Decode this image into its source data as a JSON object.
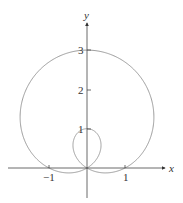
{
  "chart_data": {
    "type": "line",
    "subtype": "polar-curve",
    "equation": "r = 1 + 2 sin θ",
    "title": "",
    "xlabel": "x",
    "ylabel": "y",
    "x_ticks": [
      -1,
      1
    ],
    "x_tick_labels": [
      "−1",
      "1"
    ],
    "y_ticks": [
      1,
      2,
      3
    ],
    "y_tick_labels": [
      "1",
      "2",
      "3"
    ],
    "xlim": [
      -2.1,
      2.1
    ],
    "ylim": [
      -0.8,
      3.8
    ],
    "grid": false,
    "legend": null,
    "key_points": [
      {
        "x": 0,
        "y": 3,
        "note": "outer loop top"
      },
      {
        "x": 0,
        "y": 1,
        "note": "inner loop top"
      },
      {
        "x": 0,
        "y": 0,
        "note": "pole / self-intersection"
      },
      {
        "x": 1,
        "y": 0
      },
      {
        "x": -1,
        "y": 0
      }
    ],
    "colors": {
      "curve": "#9a9a9a",
      "axes": "#444444"
    }
  },
  "labels": {
    "x_axis": "x",
    "y_axis": "y",
    "xt_neg1": "−1",
    "xt_1": "1",
    "yt_1": "1",
    "yt_2": "2",
    "yt_3": "3"
  }
}
